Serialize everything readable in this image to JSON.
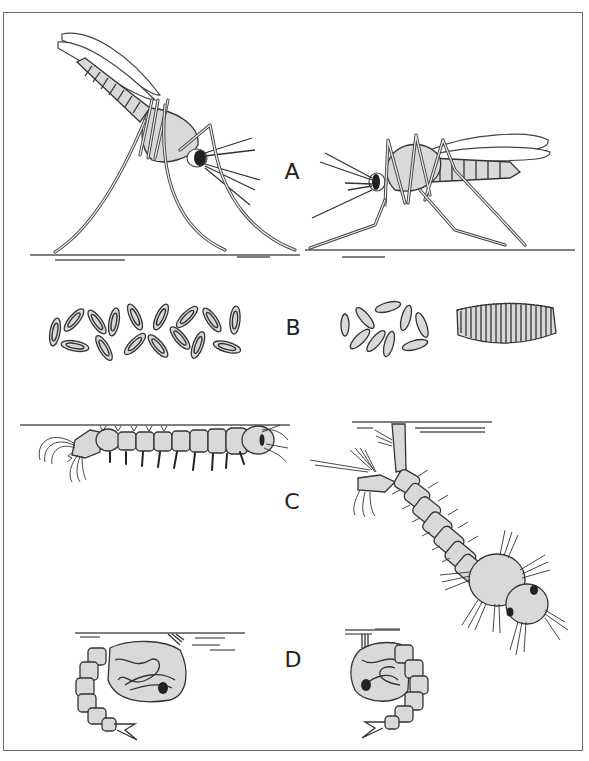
{
  "figure": {
    "panels": [
      {
        "id": "A",
        "label": "A",
        "stage": "adult",
        "left": "adult resting angled to surface",
        "right": "adult resting parallel to surface"
      },
      {
        "id": "B",
        "label": "B",
        "stage": "eggs",
        "left": "eggs with floats laid singly",
        "right_1": "eggs laid singly without floats",
        "right_2": "eggs in raft"
      },
      {
        "id": "C",
        "label": "C",
        "stage": "larva",
        "left": "larva parallel to water surface",
        "right": "larva hanging from surface by siphon"
      },
      {
        "id": "D",
        "label": "D",
        "stage": "pupa",
        "left": "pupa at surface",
        "right": "pupa at surface"
      }
    ]
  },
  "colors": {
    "fill": "#d9d9d9",
    "outline": "#333333",
    "frame": "#6a6a6a",
    "eye": "#222222"
  }
}
